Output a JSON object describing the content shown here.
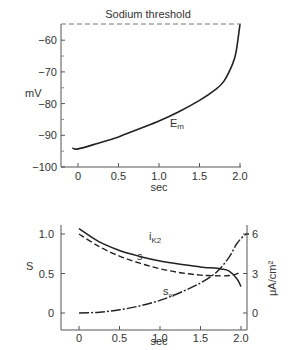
{
  "chart_data": [
    {
      "type": "line",
      "title": "",
      "annotation": "Sodium threshold",
      "xlabel": "sec",
      "ylabel": "mV",
      "xlim": [
        -0.1,
        2.0
      ],
      "ylim": [
        -100,
        -55
      ],
      "xticks": [
        "0",
        "0.5",
        "1.0",
        "1.5",
        "2.0"
      ],
      "yticks": [
        "-60",
        "-70",
        "-80",
        "-90",
        "-100"
      ],
      "threshold": -55,
      "series": [
        {
          "name": "E_m",
          "label": "E",
          "label_sub": "m",
          "style": "solid",
          "x": [
            -0.07,
            0.0,
            0.25,
            0.5,
            0.75,
            1.0,
            1.25,
            1.5,
            1.7,
            1.8,
            1.9,
            1.95,
            2.0
          ],
          "y": [
            -94,
            -94.3,
            -92.5,
            -90.5,
            -88,
            -85.5,
            -82.5,
            -79,
            -75.5,
            -73,
            -68,
            -64,
            -55
          ]
        }
      ]
    },
    {
      "type": "line",
      "xlabel": "sec",
      "ylabel_left": "S",
      "ylabel_right": "μA/cm²",
      "xlim": [
        -0.2,
        2.1
      ],
      "ylim_left": [
        -0.2,
        1.1
      ],
      "ylim_right": [
        -1.2,
        6.6
      ],
      "xticks": [
        "0",
        "0.5",
        "1.0",
        "1.5",
        "2.0"
      ],
      "yticks_left": [
        "0",
        "0.5",
        "1.0"
      ],
      "yticks_right": [
        "0",
        "3",
        "6"
      ],
      "series": [
        {
          "name": "i_K2",
          "label": "i",
          "label_sub": "K2",
          "style": "solid",
          "axis": "right",
          "x": [
            0.0,
            0.25,
            0.5,
            0.75,
            1.0,
            1.25,
            1.5,
            1.75,
            1.85,
            1.95,
            2.0
          ],
          "y": [
            6.4,
            5.4,
            4.75,
            4.3,
            3.95,
            3.7,
            3.5,
            3.35,
            3.2,
            2.6,
            2.0
          ]
        },
        {
          "name": "s",
          "label": "s",
          "style": "dashed",
          "axis": "left",
          "x": [
            0.0,
            0.25,
            0.5,
            0.75,
            1.0,
            1.25,
            1.5,
            1.75,
            1.9,
            2.0
          ],
          "y": [
            1.0,
            0.84,
            0.72,
            0.63,
            0.56,
            0.51,
            0.48,
            0.47,
            0.48,
            0.52
          ]
        },
        {
          "name": "s_inf",
          "label": "s",
          "label_sub": "∞",
          "style": "dash-dot",
          "axis": "left",
          "x": [
            0.0,
            0.25,
            0.5,
            0.75,
            1.0,
            1.25,
            1.5,
            1.7,
            1.85,
            1.95,
            2.05,
            2.1
          ],
          "y": [
            0.0,
            0.01,
            0.04,
            0.09,
            0.16,
            0.26,
            0.38,
            0.52,
            0.7,
            0.88,
            0.99,
            1.0
          ]
        }
      ]
    }
  ]
}
